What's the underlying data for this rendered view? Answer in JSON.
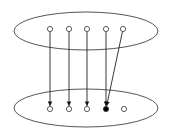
{
  "canvas": {
    "width": 170,
    "height": 133,
    "background": "#ffffff"
  },
  "colors": {
    "stroke": "#555555",
    "edge": "#222222",
    "node_fill": "#ffffff",
    "highlight_fill": "#000000"
  },
  "sets": [
    {
      "id": "top-set",
      "cx": 86,
      "cy": 31,
      "rx": 72,
      "ry": 19
    },
    {
      "id": "bottom-set",
      "cx": 86,
      "cy": 108,
      "rx": 72,
      "ry": 19
    }
  ],
  "nodes": {
    "top": [
      {
        "x": 50,
        "y": 29,
        "filled": false
      },
      {
        "x": 69,
        "y": 29,
        "filled": false
      },
      {
        "x": 87,
        "y": 29,
        "filled": false
      },
      {
        "x": 106,
        "y": 29,
        "filled": false
      },
      {
        "x": 123,
        "y": 29,
        "filled": false
      }
    ],
    "bottom": [
      {
        "x": 50,
        "y": 109,
        "filled": false
      },
      {
        "x": 69,
        "y": 109,
        "filled": false
      },
      {
        "x": 87,
        "y": 109,
        "filled": false
      },
      {
        "x": 106,
        "y": 109,
        "filled": true
      },
      {
        "x": 124,
        "y": 109,
        "filled": false
      }
    ]
  },
  "edges": [
    {
      "from": 0,
      "to": 0
    },
    {
      "from": 1,
      "to": 1
    },
    {
      "from": 2,
      "to": 2
    },
    {
      "from": 3,
      "to": 3
    },
    {
      "from": 4,
      "to": 3
    }
  ]
}
